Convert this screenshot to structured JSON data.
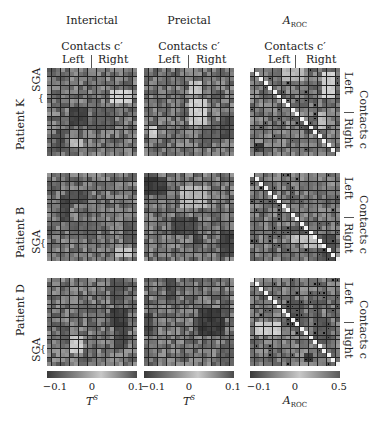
{
  "columns": [
    {
      "title": "Interictal",
      "contacts_label": "Contacts c′",
      "left": "Left",
      "right": "Right",
      "x": 47
    },
    {
      "title": "Preictal",
      "contacts_label": "Contacts c′",
      "left": "Left",
      "right": "Right",
      "x": 144
    },
    {
      "title": "A",
      "title_sub": "ROC",
      "contacts_label": "Contacts c′",
      "left": "Left",
      "right": "Right",
      "x": 250
    }
  ],
  "rows": [
    {
      "patient": "Patient K",
      "sga": "SGA",
      "y": 68
    },
    {
      "patient": "Patient B",
      "sga": "SGA",
      "y": 173
    },
    {
      "patient": "Patient D",
      "sga": "SGA",
      "y": 278
    }
  ],
  "right_axis": {
    "label": "Contacts c",
    "left": "Left",
    "right": "Right"
  },
  "colorbars": [
    {
      "ticks": [
        "−0.1",
        "0",
        "0.1"
      ],
      "label": "T",
      "label_sup": "S"
    },
    {
      "ticks": [
        "−0.1",
        "0",
        "0.1"
      ],
      "label": "T",
      "label_sup": "S"
    },
    {
      "ticks": [
        "−0.1",
        "0",
        "0.5"
      ],
      "label": "A",
      "label_sub": "ROC"
    }
  ],
  "chart_data": {
    "type": "heatmap",
    "title": "",
    "grid_size": [
      20,
      20
    ],
    "panels": [
      {
        "row": "Patient K",
        "col": "Interictal",
        "vmin": -0.1,
        "vmax": 0.1,
        "seed": 11
      },
      {
        "row": "Patient K",
        "col": "Preictal",
        "vmin": -0.1,
        "vmax": 0.1,
        "seed": 12
      },
      {
        "row": "Patient K",
        "col": "A_ROC",
        "vmin": -0.1,
        "vmax": 0.5,
        "seed": 13,
        "diagonal": true
      },
      {
        "row": "Patient B",
        "col": "Interictal",
        "vmin": -0.1,
        "vmax": 0.1,
        "seed": 21
      },
      {
        "row": "Patient B",
        "col": "Preictal",
        "vmin": -0.1,
        "vmax": 0.1,
        "seed": 22
      },
      {
        "row": "Patient B",
        "col": "A_ROC",
        "vmin": -0.1,
        "vmax": 0.5,
        "seed": 23,
        "diagonal": true
      },
      {
        "row": "Patient D",
        "col": "Interictal",
        "vmin": -0.1,
        "vmax": 0.1,
        "seed": 31
      },
      {
        "row": "Patient D",
        "col": "Preictal",
        "vmin": -0.1,
        "vmax": 0.1,
        "seed": 32
      },
      {
        "row": "Patient D",
        "col": "A_ROC",
        "vmin": -0.1,
        "vmax": 0.5,
        "seed": 33,
        "diagonal": true
      }
    ],
    "xlabel": [
      "T^S",
      "T^S",
      "A_ROC"
    ],
    "ylabel": "Contacts c",
    "colorbar": [
      {
        "range": [
          -0.1,
          0.1
        ]
      },
      {
        "range": [
          -0.1,
          0.1
        ]
      },
      {
        "range": [
          -0.1,
          0.5
        ]
      }
    ],
    "grid": true,
    "legend": "none"
  }
}
